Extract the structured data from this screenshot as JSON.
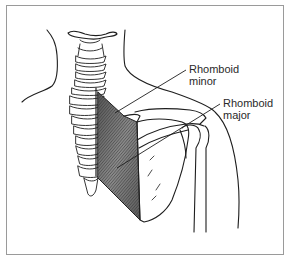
{
  "figure": {
    "labels": [
      {
        "id": "rhomboid-minor",
        "line1": "Rhomboid",
        "line2": "minor"
      },
      {
        "id": "rhomboid-major",
        "line1": "Rhomboid",
        "line2": "major"
      }
    ],
    "colors": {
      "frame": "#9a9a9a",
      "ink": "#1e1e1e",
      "muscle_shade": "#6e6e6e",
      "background": "#ffffff"
    }
  }
}
